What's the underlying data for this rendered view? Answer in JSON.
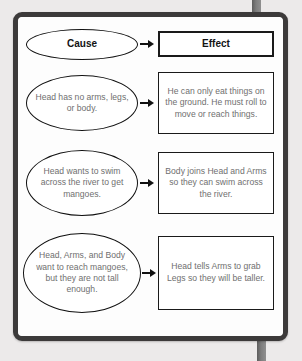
{
  "diagram": {
    "colors": {
      "page_background": "#eceaea",
      "frame": "#3c3a3a",
      "card": "#ffffff",
      "header_text": "#131313",
      "body_text": "#6f6f6f",
      "shape_outline": "#111111",
      "post": "#7d7d7d"
    },
    "header": {
      "cause_label": "Cause",
      "effect_label": "Effect"
    },
    "rows": [
      {
        "cause": "Head has no arms, legs, or body.",
        "effect": "He can only eat things on the ground. He must roll to move or reach things."
      },
      {
        "cause": "Head wants to swim across the river to get mangoes.",
        "effect": "Body joins Head and Arms so they can swim across the river."
      },
      {
        "cause": "Head, Arms, and Body want to reach mangoes, but they are not tall enough.",
        "effect": "Head tells Arms to grab Legs so they will be taller."
      }
    ],
    "arrow_icon": "right-arrow-icon"
  }
}
